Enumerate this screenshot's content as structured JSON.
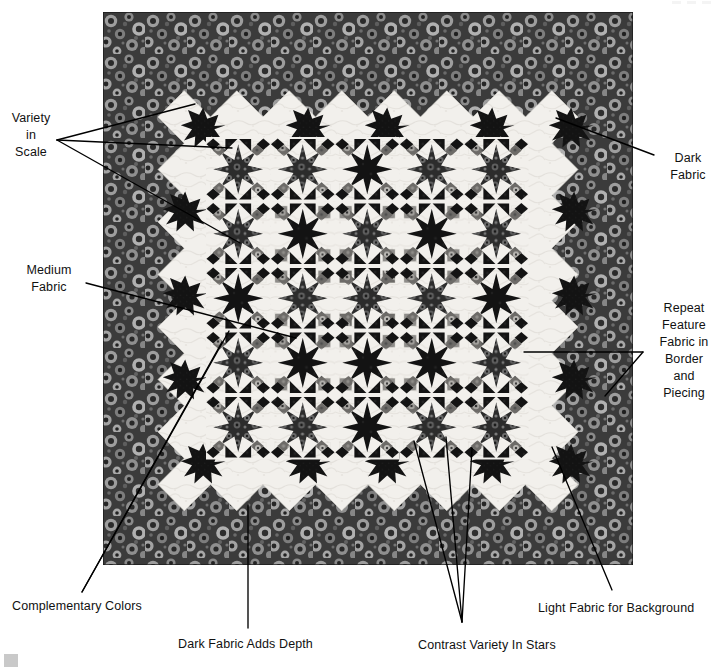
{
  "figure": {
    "colors": {
      "dark_fabric": "#151515",
      "medium_fabric": "#8d8d8d",
      "light_background": "#f2f0ec",
      "border_print_dark": "#4a4a4a",
      "border_print_light": "#b6b6b6",
      "leader_line": "#000000",
      "page_background": "#ffffff",
      "corner_swatch": "#c9c9c9"
    },
    "geometry": {
      "quilt_left": 103,
      "quilt_top": 12,
      "quilt_width": 530,
      "quilt_height": 553,
      "border_width": 58,
      "grid_columns": 5,
      "grid_rows": 5
    }
  },
  "annotations": [
    {
      "id": "variety-in-scale",
      "label": "Variety\nin\nScale",
      "position": "left-top",
      "x": 8,
      "y": 110,
      "width": 46,
      "align": "center",
      "leaders": [
        {
          "from": [
            57,
            140
          ],
          "to": [
            195,
            104
          ]
        },
        {
          "from": [
            57,
            140
          ],
          "to": [
            232,
            148
          ]
        },
        {
          "from": [
            57,
            140
          ],
          "to": [
            240,
            243
          ]
        }
      ]
    },
    {
      "id": "dark-fabric",
      "label": "Dark\nFabric",
      "position": "right-top",
      "x": 660,
      "y": 150,
      "width": 56,
      "align": "center",
      "leaders": [
        {
          "from": [
            654,
            155
          ],
          "to": [
            556,
            118
          ]
        }
      ]
    },
    {
      "id": "medium-fabric",
      "label": "Medium\nFabric",
      "position": "left-middle",
      "x": 16,
      "y": 262,
      "width": 66,
      "align": "center",
      "leaders": [
        {
          "from": [
            86,
            283
          ],
          "to": [
            296,
            338
          ]
        }
      ]
    },
    {
      "id": "repeat-feature-fabric",
      "label": "Repeat\nFeature\nFabric in\nBorder\nand\nPiecing",
      "position": "right-middle",
      "x": 650,
      "y": 300,
      "width": 68,
      "align": "center",
      "leaders": [
        {
          "from": [
            643,
            352
          ],
          "to": [
            524,
            352
          ]
        },
        {
          "from": [
            643,
            352
          ],
          "to": [
            605,
            396
          ]
        }
      ]
    },
    {
      "id": "complementary-colors",
      "label": "Complementary Colors",
      "position": "bottom-left",
      "x": 12,
      "y": 598,
      "width": 150,
      "align": "left",
      "leaders": [
        {
          "from": [
            82,
            592
          ],
          "to": [
            229,
            331
          ]
        },
        {
          "from": [
            82,
            592
          ],
          "to": [
            222,
            342
          ]
        }
      ]
    },
    {
      "id": "dark-fabric-adds-depth",
      "label": "Dark Fabric Adds Depth",
      "position": "bottom-center-left",
      "x": 178,
      "y": 636,
      "width": 146,
      "align": "left",
      "leaders": [
        {
          "from": [
            248,
            628
          ],
          "to": [
            248,
            505
          ]
        }
      ]
    },
    {
      "id": "contrast-variety-in-stars",
      "label": "Contrast Variety In Stars",
      "position": "bottom-center-right",
      "x": 418,
      "y": 637,
      "width": 150,
      "align": "left",
      "leaders": [
        {
          "from": [
            462,
            622
          ],
          "to": [
            414,
            441
          ]
        },
        {
          "from": [
            462,
            622
          ],
          "to": [
            446,
            437
          ]
        },
        {
          "from": [
            462,
            622
          ],
          "to": [
            472,
            448
          ]
        }
      ]
    },
    {
      "id": "light-fabric-for-background",
      "label": "Light Fabric for Background",
      "position": "bottom-right",
      "x": 538,
      "y": 600,
      "width": 178,
      "align": "left",
      "leaders": [
        {
          "from": [
            612,
            590
          ],
          "to": [
            552,
            447
          ]
        }
      ]
    }
  ]
}
